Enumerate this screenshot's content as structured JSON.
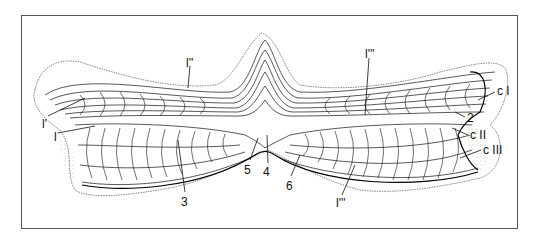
{
  "figure": {
    "type": "histological line drawing",
    "frame_color": "#555555",
    "ink_color": "#111111"
  },
  "labels": [
    {
      "id": "l-double-prime",
      "text": "l''",
      "x": 186,
      "y": 57
    },
    {
      "id": "l-prime",
      "text": "l'",
      "x": 42,
      "y": 118
    },
    {
      "id": "l",
      "text": "l",
      "x": 54,
      "y": 131
    },
    {
      "id": "l-triple-prime-top",
      "text": "l'''",
      "x": 365,
      "y": 50
    },
    {
      "id": "c-I",
      "text": "c I",
      "x": 497,
      "y": 87
    },
    {
      "id": "2",
      "text": "2",
      "x": 467,
      "y": 114
    },
    {
      "id": "c-II",
      "text": "c II",
      "x": 470,
      "y": 131
    },
    {
      "id": "c-III",
      "text": "c III",
      "x": 483,
      "y": 146
    },
    {
      "id": "3",
      "text": "3",
      "x": 183,
      "y": 197
    },
    {
      "id": "5",
      "text": "5",
      "x": 245,
      "y": 164
    },
    {
      "id": "4",
      "text": "4",
      "x": 264,
      "y": 167
    },
    {
      "id": "6",
      "text": "6",
      "x": 286,
      "y": 180
    },
    {
      "id": "l-triple-prime-bottom",
      "text": "l'''",
      "x": 337,
      "y": 198
    }
  ]
}
